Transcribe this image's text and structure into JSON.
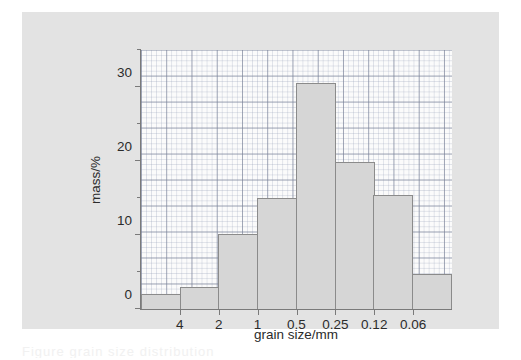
{
  "figure": {
    "background_color": "#e3e3e3",
    "plot_background_color": "#fbfbfb",
    "bar_fill_color": "#d6d6d6",
    "bar_edge_color": "#8b8b8b",
    "axis_color": "#7a7a7a",
    "caption_fragment": "Figure   grain size distribution"
  },
  "chart_data": {
    "type": "bar",
    "title": "",
    "xlabel": "grain size/mm",
    "ylabel": "mass/%",
    "grid": true,
    "legend": null,
    "ylim": [
      0,
      35
    ],
    "y_ticks_major": [
      "0",
      "10",
      "20",
      "30"
    ],
    "y_tick_major_values": [
      0,
      10,
      20,
      30
    ],
    "y_tick_minor_values": [
      5,
      15,
      25,
      35
    ],
    "x_tick_labels": [
      "4",
      "2",
      "1",
      "0.5",
      "0.25",
      "0.12",
      "0.06"
    ],
    "x_tick_note": "labels sit on the boundaries between adjacent bars; axis is a descending sieve-size scale",
    "categories": [
      ">4",
      "4-2",
      "2-1",
      "1-0.5",
      "0.5-0.25",
      "0.25-0.12",
      "0.12-0.06",
      "<0.06"
    ],
    "values": [
      2.0,
      3.0,
      10.2,
      15.0,
      30.6,
      19.8,
      15.4,
      4.7
    ]
  }
}
